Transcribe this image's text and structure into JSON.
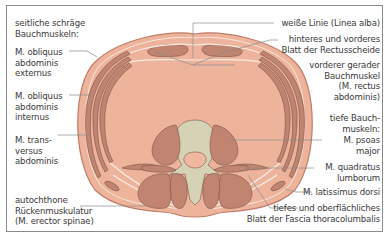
{
  "diagram": {
    "type": "anatomical-cross-section",
    "colors": {
      "skin": "#f0b8a0",
      "body": "#eeb49b",
      "muscle": "#c98d7a",
      "muscle_outline": "#7a5448",
      "fascia": "#f8ece6",
      "bone": "#d6d2b6",
      "leader": "#8a8a8a",
      "text": "#3a3a3a"
    },
    "labels_left": {
      "heading_1": "seitliche schräge",
      "heading_2": "Bauchmuskeln:",
      "ext_1": "M. obliquus",
      "ext_2": "abdominis",
      "ext_3": "externus",
      "int_1": "M. obliquus",
      "int_2": "abdominis",
      "int_3": "internus",
      "trans_1": "M. trans-",
      "trans_2": "versus",
      "trans_3": "abdominis",
      "erector_1": "autochthone",
      "erector_2": "Rückenmuskulatur",
      "erector_3": "(M. erector spinae)"
    },
    "labels_right": {
      "linea_alba": "weiße Linie (Linea alba)",
      "sheath_1": "hinteres und vorderes",
      "sheath_2": "Blatt der Rectusscheide",
      "rectus_1": "vorderer gerader",
      "rectus_2": "Bauchmuskel",
      "rectus_3": "(M. rectus",
      "rectus_4": "abdominis)",
      "deep_1": "tiefe Bauch-",
      "deep_2": "muskeln:",
      "psoas_1": "M. psoas",
      "psoas_2": "major",
      "quad_1": "M. quadratus",
      "quad_2": "lumborum",
      "lat": "M. latissimus dorsi",
      "fascia_1": "tiefes und oberflächliches",
      "fascia_2": "Blatt der Fascia thoracolumbalis"
    }
  }
}
